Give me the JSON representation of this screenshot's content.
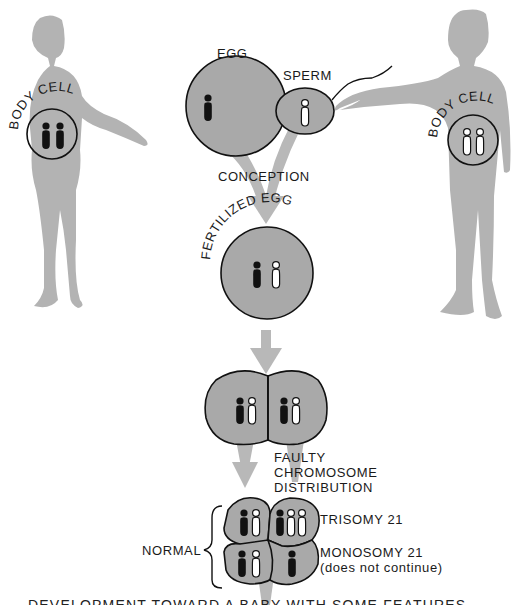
{
  "diagram": {
    "colors": {
      "silhouette": "#b3b3b3",
      "cell_fill": "#a9a9a9",
      "cell_outline": "#1a1a1a",
      "arrow": "#b8b8b8",
      "maternal_chromosome": "#111111",
      "paternal_chromosome": "#ffffff",
      "background": "#ffffff"
    },
    "mother": {
      "label": "BODY CELL",
      "chromosomes": [
        "maternal",
        "maternal"
      ]
    },
    "father": {
      "label": "BODY CELL",
      "chromosomes": [
        "paternal",
        "paternal"
      ]
    },
    "egg": {
      "label": "EGG",
      "chromosomes": [
        "maternal"
      ]
    },
    "sperm": {
      "label": "SPERM",
      "chromosomes": [
        "paternal"
      ]
    },
    "conception_label": "CONCEPTION",
    "fertilized_egg": {
      "label": "FERTILIZED EGG",
      "chromosomes": [
        "maternal",
        "paternal"
      ]
    },
    "two_cell_stage": {
      "cells": [
        {
          "chromosomes": [
            "maternal",
            "paternal"
          ]
        },
        {
          "chromosomes": [
            "maternal",
            "paternal"
          ]
        }
      ]
    },
    "faulty_distribution_label": [
      "FAULTY",
      "CHROMOSOME",
      "DISTRIBUTION"
    ],
    "four_cell_stage": {
      "normal_label": "NORMAL",
      "cells": [
        {
          "position": "top-left",
          "type": "normal",
          "chromosomes": [
            "maternal",
            "paternal"
          ]
        },
        {
          "position": "top-right",
          "type": "trisomy",
          "chromosomes": [
            "maternal",
            "paternal",
            "paternal"
          ]
        },
        {
          "position": "bottom-left",
          "type": "normal",
          "chromosomes": [
            "maternal",
            "paternal"
          ]
        },
        {
          "position": "bottom-right",
          "type": "monosomy",
          "chromosomes": [
            "maternal"
          ]
        }
      ],
      "trisomy_label": "TRISOMY 21",
      "monosomy_label": "MONOSOMY 21",
      "monosomy_note": "(does not continue)"
    },
    "bottom_caption": "DEVELOPMENT TOWARD A BABY WITH SOME FEATURES"
  }
}
